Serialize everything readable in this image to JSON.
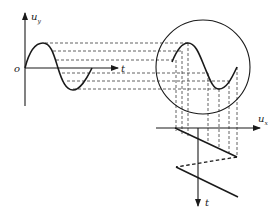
{
  "figure": {
    "left_plot": {
      "vertical_axis_label": "u",
      "vertical_axis_subscript": "y",
      "horizontal_axis_label": "t",
      "origin_label": "o",
      "signal": "sine",
      "cycles": 1
    },
    "screen": {
      "shape": "circle",
      "displayed_signal": "sine",
      "cycles": 1
    },
    "sweep_plot": {
      "horizontal_axis_label": "u",
      "horizontal_axis_subscript": "x",
      "vertical_axis_label": "t",
      "signal": "sawtooth",
      "ramps": 2,
      "retrace_style": "dashed"
    },
    "projection_lines": {
      "horizontal_count": 6,
      "vertical_count": 6,
      "style": "dashed"
    }
  }
}
